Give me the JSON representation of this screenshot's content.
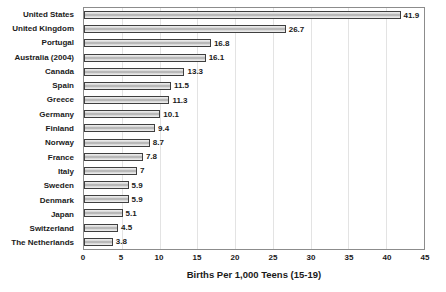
{
  "chart_data": {
    "type": "bar",
    "orientation": "horizontal",
    "categories": [
      "United States",
      "United Kingdom",
      "Portugal",
      "Australia (2004)",
      "Canada",
      "Spain",
      "Greece",
      "Germany",
      "Finland",
      "Norway",
      "France",
      "Italy",
      "Sweden",
      "Denmark",
      "Japan",
      "Switzerland",
      "The Netherlands"
    ],
    "values": [
      41.9,
      26.7,
      16.8,
      16.1,
      13.3,
      11.5,
      11.3,
      10.1,
      9.4,
      8.7,
      7.8,
      7,
      5.9,
      5.9,
      5.1,
      4.5,
      3.8
    ],
    "value_labels": [
      "41.9",
      "26.7",
      "16.8",
      "16.1",
      "13.3",
      "11.5",
      "11.3",
      "10.1",
      "9.4",
      "8.7",
      "7.8",
      "7",
      "5.9",
      "5.9",
      "5.1",
      "4.5",
      "3.8"
    ],
    "title": "",
    "xlabel": "Births Per 1,000 Teens (15-19)",
    "ylabel": "",
    "xlim": [
      0,
      45
    ],
    "xticks": [
      0,
      5,
      10,
      15,
      20,
      25,
      30,
      35,
      40,
      45
    ],
    "grid": "vertical-on",
    "legend": "none",
    "colors": {
      "bar_fill_light": "#f0f0f0",
      "bar_fill_mid": "#a6a6a6",
      "bar_border": "#3f3f3f",
      "gridline": "#e3e3e3",
      "plot_border": "#8c8c8c",
      "text": "#1a1a1a",
      "background": "#ffffff"
    }
  }
}
